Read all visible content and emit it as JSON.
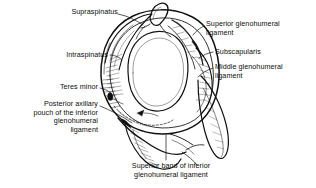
{
  "figure": {
    "type": "anatomical-illustration",
    "background_color": "#ffffff",
    "ink_color": "#111111",
    "labels": {
      "supraspinatus": "Supraspinatus",
      "intraspinatus": "Intraspinatus",
      "teres_minor": "Teres minor",
      "posterior_axillary_pouch": "Posterior axillary\npouch of the inferior\nglenohumeral\nligament",
      "superior_glenohumeral_ligament": "Superior glenohumeral\nligament",
      "subscapularis": "Subscapularis",
      "middle_glenohumeral_ligament": "Middle glenohumeral\nligament",
      "superior_band_inferior_gh": "Superior band of inferior\nglenohumeral ligament"
    }
  }
}
